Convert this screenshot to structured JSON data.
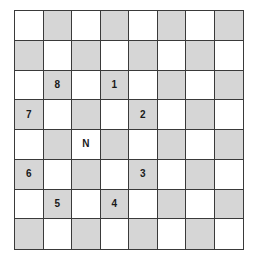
{
  "board": {
    "rows": 8,
    "cols": 8,
    "colors": {
      "light": "#ffffff",
      "dark": "#d6d6d6",
      "line": "#3a3a3a"
    },
    "piece": {
      "symbol": "N",
      "row": 4,
      "col": 2
    },
    "markers": [
      {
        "label": "1",
        "row": 2,
        "col": 3
      },
      {
        "label": "2",
        "row": 3,
        "col": 4
      },
      {
        "label": "3",
        "row": 5,
        "col": 4
      },
      {
        "label": "4",
        "row": 6,
        "col": 3
      },
      {
        "label": "5",
        "row": 6,
        "col": 1
      },
      {
        "label": "6",
        "row": 5,
        "col": 0
      },
      {
        "label": "7",
        "row": 3,
        "col": 0
      },
      {
        "label": "8",
        "row": 2,
        "col": 1
      }
    ],
    "cells": [
      [
        "",
        "",
        "",
        "",
        "",
        "",
        "",
        ""
      ],
      [
        "",
        "",
        "",
        "",
        "",
        "",
        "",
        ""
      ],
      [
        "",
        "8",
        "",
        "1",
        "",
        "",
        "",
        ""
      ],
      [
        "7",
        "",
        "",
        "",
        "2",
        "",
        "",
        ""
      ],
      [
        "",
        "",
        "N",
        "",
        "",
        "",
        "",
        ""
      ],
      [
        "6",
        "",
        "",
        "",
        "3",
        "",
        "",
        ""
      ],
      [
        "",
        "5",
        "",
        "4",
        "",
        "",
        "",
        ""
      ],
      [
        "",
        "",
        "",
        "",
        "",
        "",
        "",
        ""
      ]
    ]
  }
}
